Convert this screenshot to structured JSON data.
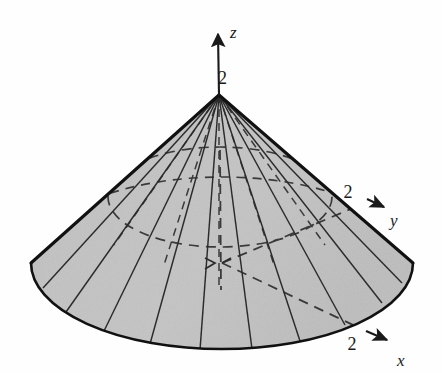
{
  "figure": {
    "type": "3d-diagram",
    "background_color": "#fefefe",
    "surface_fill": "#d4d4d4",
    "surface_fill_light": "#dcdcdc",
    "line_color": "#1a1a1a",
    "outline_color": "#111111"
  },
  "geometry": {
    "apex": {
      "x": 219,
      "y": 95
    },
    "base_center": {
      "x": 222,
      "y": 263
    },
    "base_radius_x": 191,
    "base_radius_y": 86,
    "mid_ellipse_center": {
      "x": 220,
      "y": 197
    },
    "mid_ellipse_radius_x": 112,
    "mid_ellipse_radius_y": 50,
    "meridian_count": 16
  },
  "axes": {
    "z": {
      "name": "z-axis",
      "label": "z",
      "tick_label": "2",
      "label_pos": {
        "x": 232,
        "y": 36
      },
      "tick_pos": {
        "x": 224,
        "y": 82
      },
      "line_from": {
        "x": 219,
        "y": 95
      },
      "line_to": {
        "x": 218,
        "y": 32
      },
      "arrow_tip": {
        "x": 218,
        "y": 22
      },
      "style": "solid"
    },
    "y": {
      "name": "y-axis",
      "label": "y",
      "tick_label": "2",
      "label_pos": {
        "x": 392,
        "y": 220
      },
      "tick_pos": {
        "x": 357,
        "y": 195
      },
      "line_from": {
        "x": 222,
        "y": 263
      },
      "line_to": {
        "x": 372,
        "y": 202
      },
      "arrow_tip": {
        "x": 386,
        "y": 208
      },
      "style": "dashed-then-solid",
      "surface_exit": {
        "x": 367,
        "y": 199
      }
    },
    "x": {
      "name": "x-axis",
      "label": "x",
      "tick_label": "2",
      "label_pos": {
        "x": 404,
        "y": 362
      },
      "tick_pos": {
        "x": 361,
        "y": 344
      },
      "line_from": {
        "x": 222,
        "y": 263
      },
      "line_to": {
        "x": 390,
        "y": 334
      },
      "arrow_tip": {
        "x": 402,
        "y": 341
      },
      "style": "dashed-then-solid",
      "surface_exit": {
        "x": 366,
        "y": 331
      }
    }
  },
  "annotations": {
    "origin_marker": "dashed-crosshair",
    "hidden_edges": "dashed",
    "visible_edges": "solid",
    "hidden_circle": "dashed ellipse across cone surface"
  },
  "labels": {
    "z_tick": "2",
    "y_tick": "2",
    "x_tick": "2",
    "z_axis": "z",
    "y_axis": "y",
    "x_axis": "x"
  }
}
